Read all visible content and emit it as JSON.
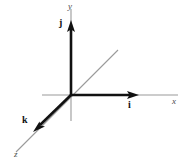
{
  "figure": {
    "kind": "3d-coordinate-axes-with-unit-vectors",
    "width": 187,
    "height": 164,
    "background_color": "#ffffff",
    "origin": {
      "x": 71,
      "y": 95
    },
    "colors": {
      "axis_line": "#9a9a9a",
      "vector": "#111111",
      "axis_label_text": "#4a4a4a",
      "vector_label_text": "#111111"
    },
    "axes": [
      {
        "name": "x-axis",
        "label": "x",
        "orientation": "horizontal",
        "from": {
          "x": 42,
          "y": 95
        },
        "to": {
          "x": 178,
          "y": 95
        },
        "color": "#9a9a9a"
      },
      {
        "name": "y-axis",
        "label": "y",
        "orientation": "vertical",
        "from": {
          "x": 71,
          "y": 9
        },
        "to": {
          "x": 71,
          "y": 121
        },
        "color": "#9a9a9a"
      },
      {
        "name": "z-axis",
        "label": "z",
        "orientation": "diagonal",
        "from": {
          "x": 118,
          "y": 50
        },
        "to": {
          "x": 16,
          "y": 152
        },
        "color": "#9a9a9a"
      }
    ],
    "vectors": [
      {
        "name": "i",
        "label": "i",
        "description": "unit vector along positive x-axis",
        "from": {
          "x": 71,
          "y": 95
        },
        "to": {
          "x": 139,
          "y": 95
        },
        "color": "#111111"
      },
      {
        "name": "j",
        "label": "j",
        "description": "unit vector along positive y-axis",
        "from": {
          "x": 71,
          "y": 95
        },
        "to": {
          "x": 71,
          "y": 20
        },
        "color": "#111111"
      },
      {
        "name": "k",
        "label": "k",
        "description": "unit vector along positive z-axis",
        "from": {
          "x": 71,
          "y": 95
        },
        "to": {
          "x": 33,
          "y": 132
        },
        "color": "#111111"
      }
    ]
  }
}
